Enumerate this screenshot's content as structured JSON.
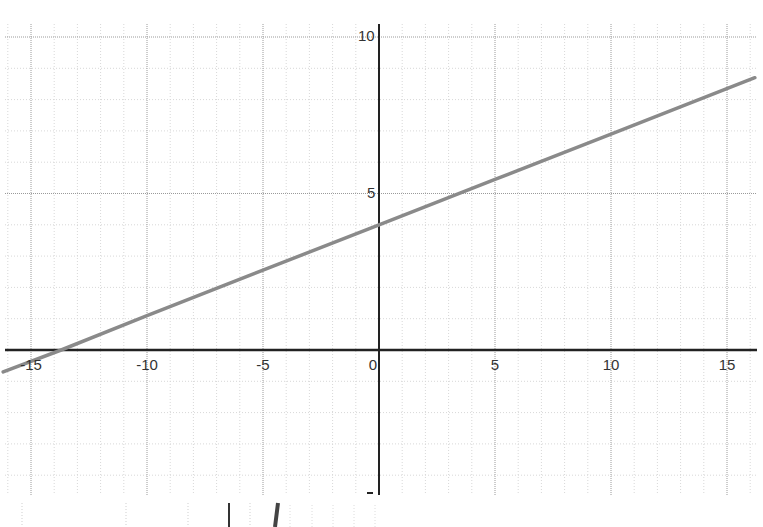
{
  "chart_data": {
    "type": "line",
    "title": "",
    "xlabel": "",
    "ylabel": "",
    "xlim": [
      -16.2,
      16.2
    ],
    "ylim": [
      -6.2,
      10.5
    ],
    "grid": true,
    "legend": null,
    "x_ticks": [
      -15,
      -10,
      -5,
      0,
      5,
      10,
      15
    ],
    "x_tick_labels": [
      "-15",
      "-10",
      "-5",
      "0",
      "5",
      "10",
      "15"
    ],
    "y_ticks": [
      5,
      10
    ],
    "y_tick_labels": [
      "5",
      "10"
    ],
    "series": [
      {
        "name": "line",
        "equation": "y = 0.29x + 4",
        "x": [
          -16.2,
          -13.7,
          -10,
          -5,
          0,
          5,
          10,
          16.2
        ],
        "y": [
          -0.7,
          0,
          1.1,
          2.55,
          4,
          5.45,
          6.9,
          8.7
        ],
        "color": "#8a8a8a"
      }
    ],
    "colors": {
      "axis": "#222222",
      "major_grid": "#9a9a9a",
      "minor_grid": "#d8d8d8",
      "line": "#8a8a8a"
    }
  }
}
